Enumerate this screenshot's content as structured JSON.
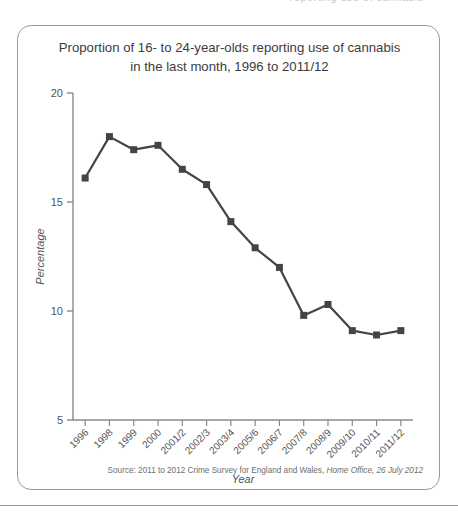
{
  "top_fragment": "reporting use of cannabis",
  "source_note": {
    "prefix": "Source: 2011 to 2012 Crime Survey for England and Wales,",
    "italic": "Home Office, 26 July 2012"
  },
  "chart_data": {
    "type": "line",
    "title": "Proportion of 16- to 24-year-olds reporting use of cannabis in the last month, 1996 to 2011/12",
    "title_line1": "Proportion of 16- to 24-year-olds reporting use of cannabis",
    "title_line2": "in the last month, 1996 to 2011/12",
    "xlabel": "Year",
    "ylabel": "Percentage",
    "categories": [
      "1996",
      "1998",
      "1999",
      "2000",
      "2001/2",
      "2002/3",
      "2003/4",
      "2005/6",
      "2006/7",
      "2007/8",
      "2008/9",
      "2009/10",
      "2010/11",
      "2011/12"
    ],
    "values": [
      16.1,
      18.0,
      17.4,
      17.6,
      16.5,
      15.8,
      14.1,
      12.9,
      12.0,
      9.8,
      10.3,
      9.1,
      8.9,
      9.1
    ],
    "ylim": [
      5,
      20
    ],
    "yticks": [
      5,
      10,
      15,
      20
    ],
    "ytick_labels": [
      "5",
      "10",
      "15",
      "20"
    ],
    "grid": false,
    "legend": false,
    "marker": "square",
    "series_color": "#444444"
  }
}
